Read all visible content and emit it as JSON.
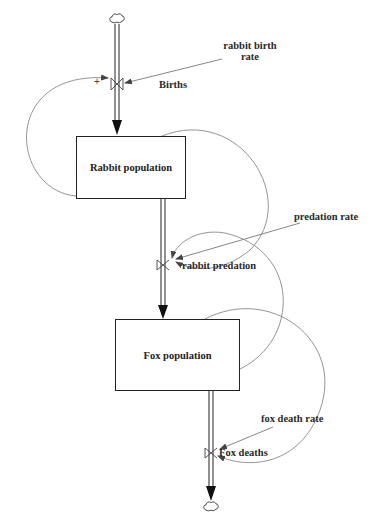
{
  "diagram": {
    "type": "stock-and-flow",
    "stocks": [
      {
        "id": "rabbit",
        "label": "Rabbit population"
      },
      {
        "id": "fox",
        "label": "Fox population"
      }
    ],
    "flows": [
      {
        "id": "births",
        "label": "Births"
      },
      {
        "id": "rabbit_predation",
        "label": "rabbit predation"
      },
      {
        "id": "fox_deaths",
        "label": "Fox deaths"
      }
    ],
    "auxiliaries": [
      {
        "id": "rabbit_birth_rate",
        "label": "rabbit birth\nrate",
        "line1": "rabbit birth",
        "line2": "rate"
      },
      {
        "id": "predation_rate",
        "label": "predation rate"
      },
      {
        "id": "fox_death_rate",
        "label": "fox death rate"
      }
    ],
    "polarity": {
      "births_loop": "+"
    },
    "colors": {
      "line": "#222222",
      "link": "#888888",
      "background": "#ffffff"
    }
  }
}
